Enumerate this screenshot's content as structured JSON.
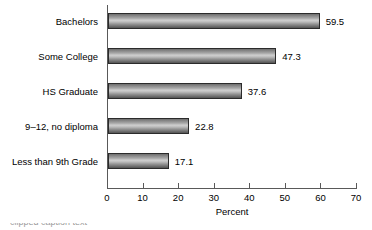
{
  "chart_data": {
    "type": "bar",
    "orientation": "horizontal",
    "title": "",
    "xlabel": "Percent",
    "ylabel": "",
    "categories": [
      "Bachelors",
      "Some College",
      "HS Graduate",
      "9–12, no diploma",
      "Less than 9th Grade"
    ],
    "values": [
      59.5,
      47.3,
      37.6,
      22.8,
      17.1
    ],
    "value_labels": [
      "59.5",
      "47.3",
      "37.6",
      "22.8",
      "17.1"
    ],
    "xlim": [
      0,
      70
    ],
    "xticks": [
      0,
      10,
      20,
      30,
      40,
      50,
      60,
      70
    ],
    "xtick_labels": [
      "0",
      "10",
      "20",
      "30",
      "40",
      "50",
      "60",
      "70"
    ],
    "grid": false,
    "legend": false,
    "bar_style": "gradient-cylinder-gray",
    "colors": {
      "background": "#ffffff",
      "bar_border": "#2b2b2b",
      "bar_light": "#cfcfcf",
      "bar_dark": "#545454",
      "axis": "#595959",
      "text": "#000000"
    }
  },
  "caption": {
    "clipped_text": "clipped caption text"
  }
}
